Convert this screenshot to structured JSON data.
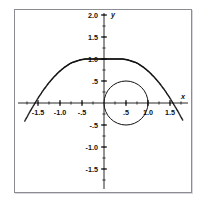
{
  "figure": {
    "background_color": "#ffffff",
    "frame_color": "#8b8b93",
    "ink_color": "#111111"
  },
  "axes": {
    "x_name": "x",
    "y_name": "y",
    "x_ticks": [
      "-1.5",
      "-1.0",
      "-.5",
      ".5",
      "1.0",
      "1.5"
    ],
    "y_ticks": [
      "2.0",
      "1.5",
      "1.0",
      ".5",
      "-.5",
      "-1.0",
      "-1.5"
    ]
  },
  "chart_data": {
    "type": "scatter",
    "title": "",
    "subtitle": "",
    "xlabel": "x",
    "ylabel": "y",
    "xlim": [
      -1.85,
      1.85
    ],
    "ylim": [
      -1.85,
      2.0
    ],
    "grid": false,
    "legend_position": "none",
    "x_tick_values": [
      -1.5,
      -1.0,
      -0.5,
      0.5,
      1.0,
      1.5
    ],
    "x_tick_labels": [
      "-1.5",
      "-1.0",
      "-.5",
      ".5",
      "1.0",
      "1.5"
    ],
    "y_tick_values": [
      2.0,
      1.5,
      1.0,
      0.5,
      -0.5,
      -1.0,
      -1.5
    ],
    "y_tick_labels": [
      "2.0",
      "1.5",
      "1.0",
      ".5",
      "-.5",
      "-1.0",
      "-1.5"
    ],
    "minor_tick_step": 0.25,
    "series": [
      {
        "name": "dotted-parabola",
        "style": "dotted",
        "marker": "dot",
        "x": [
          -1.8,
          -1.74,
          -1.68,
          -1.62,
          -1.56,
          -1.5,
          -1.44,
          -1.38,
          -1.32,
          -1.26,
          -1.2,
          -1.14,
          -1.08,
          -1.02,
          -0.96,
          -0.9,
          -0.84,
          -0.78,
          -0.72,
          -0.66,
          -0.6,
          -0.54,
          -0.48,
          -0.42,
          -0.36,
          -0.3,
          -0.24,
          -0.18,
          -0.12,
          -0.06,
          0.0,
          0.06,
          0.12,
          0.18,
          0.24,
          0.3,
          0.36,
          0.42,
          0.48,
          0.54,
          0.6,
          0.66,
          0.72,
          0.78,
          0.84,
          0.9,
          0.96,
          1.02,
          1.08,
          1.14,
          1.2,
          1.26,
          1.32,
          1.38,
          1.44,
          1.5,
          1.56,
          1.62,
          1.68,
          1.74,
          1.8
        ],
        "y": [
          -0.41,
          -0.3,
          -0.19,
          -0.09,
          0.01,
          0.11,
          0.2,
          0.29,
          0.37,
          0.45,
          0.52,
          0.59,
          0.65,
          0.71,
          0.76,
          0.81,
          0.85,
          0.89,
          0.92,
          0.94,
          0.96,
          0.98,
          0.99,
          1.0,
          1.0,
          1.0,
          1.0,
          1.0,
          1.0,
          1.0,
          1.0,
          1.0,
          1.0,
          1.0,
          1.0,
          1.0,
          1.0,
          1.0,
          0.99,
          0.98,
          0.96,
          0.94,
          0.92,
          0.89,
          0.85,
          0.81,
          0.76,
          0.71,
          0.65,
          0.59,
          0.52,
          0.45,
          0.37,
          0.29,
          0.2,
          0.11,
          0.01,
          -0.09,
          -0.19,
          -0.3,
          -0.41
        ],
        "peak": {
          "x": 0.0,
          "y": 1.0
        },
        "x_intercepts": [
          -1.55,
          1.55
        ]
      },
      {
        "name": "solid-circle",
        "style": "solid",
        "shape": "circle",
        "center": [
          0.5,
          0.0
        ],
        "radius": 0.5,
        "passes_through": [
          [
            0.0,
            0.0
          ],
          [
            1.0,
            0.0
          ],
          [
            0.5,
            0.5
          ],
          [
            0.5,
            -0.5
          ]
        ]
      }
    ]
  }
}
